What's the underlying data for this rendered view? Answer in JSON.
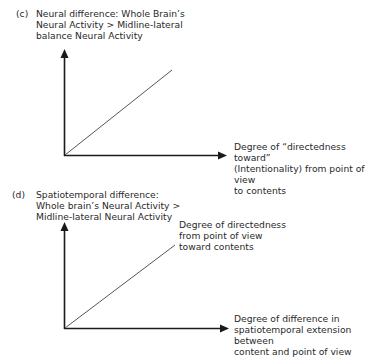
{
  "panels": [
    {
      "id": "c",
      "label": "(c)",
      "title_lines": [
        "Neural difference: Whole Brain’s",
        "Neural Activity > Midline-lateral",
        "balance Neural Activity"
      ],
      "x_axis_label_lines": [
        "Degree of “directedness toward”",
        "(Intentionality) from point of view",
        "to contents"
      ],
      "line_label_lines": []
    },
    {
      "id": "d",
      "label": "(d)",
      "title_lines": [
        "Spatiotemporal difference:",
        "Whole brain’s Neural Activity >",
        "Midline-lateral Neural Activity"
      ],
      "line_label_lines": [
        "Degree of directedness",
        "from point of view",
        "toward contents"
      ],
      "x_axis_label_lines": [
        "Degree of difference in",
        "spatiotemporal extension between",
        "content and point of view"
      ]
    }
  ],
  "colors": {
    "axis": "#1a1a1a",
    "line": "#555555",
    "text": "#2a2a2a"
  }
}
